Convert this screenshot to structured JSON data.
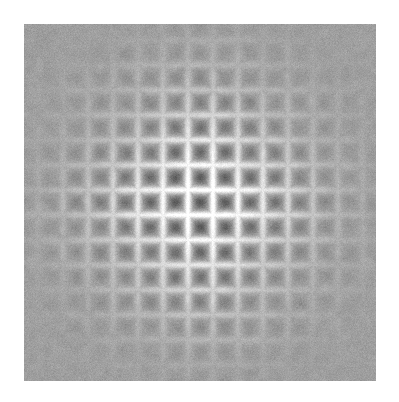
{
  "page": {
    "width": 399,
    "height": 402,
    "background_color": "#ffffff",
    "title": "2D Interference / Diffraction Intensity Map"
  },
  "figure": {
    "name": "diffraction-pattern-image",
    "panel": {
      "x": 24,
      "y": 24,
      "width": 352,
      "height": 357,
      "base_color": "#cdcdcd",
      "border": "none"
    },
    "colormap": {
      "type": "grayscale",
      "min_color": "#6a6a6a",
      "max_color": "#ffffff",
      "background_level": "#cfcfcf"
    },
    "axes_visible": false,
    "ticks_visible": false,
    "labels_visible": false,
    "colorbar_visible": false
  },
  "chart_data": {
    "type": "heatmap",
    "title": "",
    "xlabel": "",
    "ylabel": "",
    "grid": false,
    "legend": "none",
    "center": {
      "x": 176,
      "y": 178
    },
    "lattice": {
      "period_px": 25.0,
      "symmetry": "square (4-fold)",
      "orientation_deg": 0,
      "dark_spot_radius_px": 8.0,
      "bright_ridge_width_px": 3.0,
      "n_orders_visible": 7
    },
    "envelope": {
      "form": "gaussian",
      "sigma_px": 78.0,
      "amplitude": 1.0,
      "radial_cutoff_px": 170
    },
    "intensity": {
      "min": 0.0,
      "max": 1.0,
      "background": 0.62,
      "dark_minimum": 0.41,
      "bright_maximum": 0.96
    },
    "noise": {
      "type": "gaussian-white",
      "sigma": 0.035,
      "grain_px": 1
    },
    "cross_arms": {
      "present": true,
      "axis_amplitude_boost": 0.3,
      "note": "Enhanced contrast along horizontal and vertical axes through center"
    },
    "sampling": {
      "nx": 352,
      "ny": 357
    }
  }
}
